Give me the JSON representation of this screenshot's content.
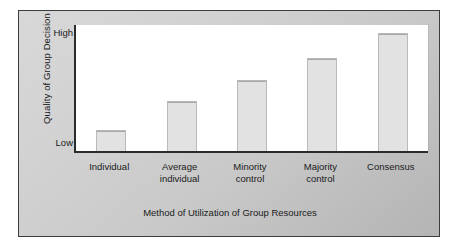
{
  "chart_data": {
    "type": "bar",
    "title": "",
    "xlabel": "Method of Utilization of Group Resources",
    "ylabel": "Quality of Group Decision",
    "categories": [
      "Individual",
      "Average individual",
      "Minority control",
      "Majority control",
      "Consensus"
    ],
    "category_lines": [
      [
        "Individual"
      ],
      [
        "Average",
        "individual"
      ],
      [
        "Minority",
        "control"
      ],
      [
        "Majority",
        "control"
      ],
      [
        "Consensus"
      ]
    ],
    "values": [
      17,
      40,
      56,
      74,
      94
    ],
    "ylim": [
      0,
      100
    ],
    "ytick_labels": [
      "High",
      "Low"
    ],
    "ytick_values": [
      100,
      0
    ],
    "grid": false,
    "legend": null,
    "bar_fill_color": "#e2e2e2",
    "bar_border_color": "#b9b9b9",
    "plot_background_color": "#ffffff",
    "figure_background_color": "#cccccc",
    "axis_color": "#2b2b2b",
    "text_color": "#1a1a1a"
  }
}
